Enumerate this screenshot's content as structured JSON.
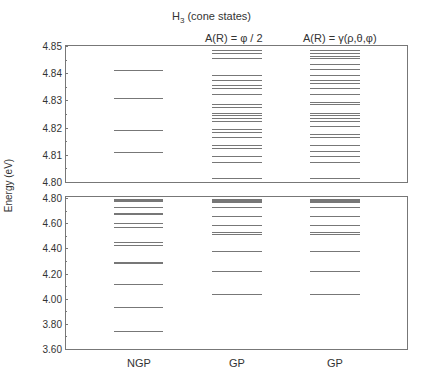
{
  "chart_data": {
    "type": "level-diagram",
    "title": "H3 (cone states)",
    "title_main": "H",
    "title_sub": "3",
    "title_rest": " (cone states)",
    "ylabel": "Energy (eV)",
    "columns": [
      {
        "label": "NGP",
        "subtitle": ""
      },
      {
        "label": "GP",
        "subtitle": "A(R) = φ / 2"
      },
      {
        "label": "GP",
        "subtitle": "A(R) = γ(ρ,θ,φ)"
      }
    ],
    "upper_panel": {
      "ylim": [
        4.8,
        4.85
      ],
      "yticks": [
        "4.85",
        "4.84",
        "4.83",
        "4.82",
        "4.81",
        "4.80"
      ],
      "levels": {
        "NGP": [
          4.841,
          4.831,
          4.819,
          4.811
        ],
        "GP_phi_half": [
          4.8485,
          4.8475,
          4.8455,
          4.8395,
          4.8375,
          4.8355,
          4.8345,
          4.8325,
          4.8285,
          4.8275,
          4.8255,
          4.8245,
          4.8235,
          4.8225,
          4.8195,
          4.8185,
          4.8165,
          4.8135,
          4.8125,
          4.8095,
          4.8075,
          4.8015
        ],
        "GP_gamma": [
          4.8485,
          4.8475,
          4.8465,
          4.8455,
          4.8435,
          4.8415,
          4.8395,
          4.8375,
          4.8365,
          4.8345,
          4.8325,
          4.8295,
          4.8285,
          4.8255,
          4.8245,
          4.8235,
          4.8225,
          4.8205,
          4.8175,
          4.8165,
          4.8135,
          4.8115,
          4.8095,
          4.8075,
          4.8015
        ]
      }
    },
    "lower_panel": {
      "ylim": [
        3.6,
        4.8
      ],
      "yticks": [
        "4.80",
        "4.60",
        "4.40",
        "4.20",
        "4.00",
        "3.80",
        "3.60"
      ],
      "levels": {
        "NGP": [
          4.79,
          4.785,
          4.78,
          4.775,
          4.727,
          4.68,
          4.675,
          4.6,
          4.57,
          4.45,
          4.43,
          4.29,
          4.28,
          4.12,
          3.93,
          3.74
        ],
        "GP_phi_half": [
          4.795,
          4.79,
          4.785,
          4.78,
          4.775,
          4.77,
          4.727,
          4.66,
          4.585,
          4.53,
          4.515,
          4.38,
          4.22,
          4.04
        ],
        "GP_gamma": [
          4.795,
          4.79,
          4.785,
          4.78,
          4.775,
          4.77,
          4.727,
          4.66,
          4.585,
          4.53,
          4.515,
          4.38,
          4.22,
          4.04
        ]
      }
    },
    "grid": false,
    "legend": "none"
  }
}
